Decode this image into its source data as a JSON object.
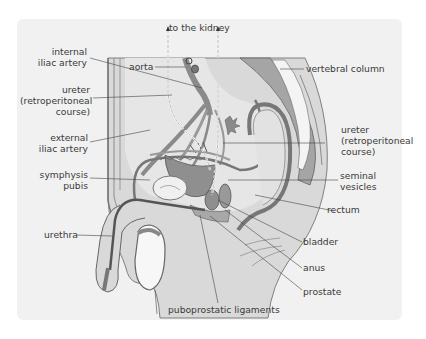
{
  "figure": {
    "colors": {
      "panel_bg": "#f1f1f1",
      "body_fill": "#d9d9d9",
      "organ_fill": "#bcbcbc",
      "dark_fill": "#8f8f8f",
      "outline": "#555555",
      "label_text": "#3a3a3a"
    },
    "labels": {
      "to_kidney": "to the kidney",
      "internal_iliac_1": "internal",
      "internal_iliac_2": "iliac artery",
      "aorta": "aorta",
      "ureter_left_1": "ureter",
      "ureter_left_2": "(retroperitoneal",
      "ureter_left_3": "course)",
      "external_iliac_1": "external",
      "external_iliac_2": "iliac artery",
      "symphysis_1": "symphysis",
      "symphysis_2": "pubis",
      "urethra": "urethra",
      "vertebral_column": "vertebral column",
      "ureter_right_1": "ureter",
      "ureter_right_2": "(retroperitoneal",
      "ureter_right_3": "course)",
      "seminal_1": "seminal",
      "seminal_2": "vesicles",
      "rectum": "rectum",
      "bladder": "bladder",
      "anus": "anus",
      "prostate": "prostate",
      "puboprostatic": "puboprostatic ligaments"
    }
  }
}
